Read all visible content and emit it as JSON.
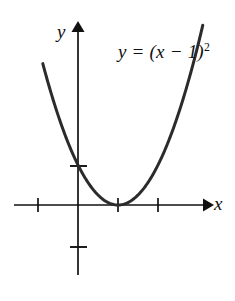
{
  "figure": {
    "background_color": "#ffffff",
    "curve_color": "#2b2b2b",
    "axis_color": "#111111",
    "equation_label": "y = (x − 1)",
    "equation_exponent": "2",
    "axis_label_x": "x",
    "axis_label_y": "y",
    "caption": ""
  },
  "chart_data": {
    "type": "line",
    "title": "",
    "subtitle": "",
    "xlabel": "x",
    "ylabel": "y",
    "annotations": [
      {
        "text": "y = (x − 1)²",
        "x": 2.0,
        "y": 4.1,
        "role": "curve-equation"
      }
    ],
    "legend": [],
    "legend_position": "none",
    "grid": false,
    "xlim": [
      -1.7,
      3.3
    ],
    "ylim": [
      -1.6,
      4.6
    ],
    "x_ticks": [
      -1,
      1,
      2
    ],
    "x_tick_labels": [
      "",
      "",
      ""
    ],
    "y_ticks": [
      -1,
      1
    ],
    "y_tick_labels": [
      "",
      ""
    ],
    "axis_arrows": {
      "x_positive": true,
      "y_positive": true
    },
    "series": [
      {
        "name": "y = (x − 1)²",
        "function": "y = (x - 1)^2",
        "vertex": [
          1,
          0
        ],
        "y_intercept": [
          0,
          1
        ],
        "color": "#2b2b2b",
        "line_width": 3,
        "x_domain": [
          -0.88,
          3.12
        ],
        "x": [
          -0.88,
          -0.7,
          -0.5,
          -0.3,
          -0.1,
          0.1,
          0.3,
          0.5,
          0.7,
          0.9,
          1.0,
          1.1,
          1.3,
          1.5,
          1.7,
          1.9,
          2.1,
          2.3,
          2.5,
          2.7,
          2.9,
          3.12
        ],
        "values": [
          3.53,
          2.89,
          2.25,
          1.69,
          1.21,
          0.81,
          0.49,
          0.25,
          0.09,
          0.01,
          0.0,
          0.01,
          0.09,
          0.25,
          0.49,
          0.81,
          1.21,
          1.69,
          2.25,
          2.89,
          3.61,
          4.49
        ]
      }
    ]
  }
}
